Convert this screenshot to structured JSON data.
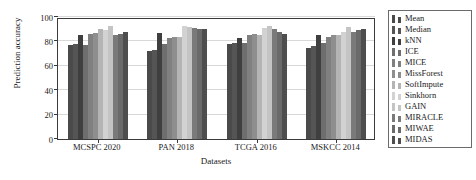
{
  "chart_data": {
    "type": "bar",
    "title": "",
    "xlabel": "Datasets",
    "ylabel": "Prediction accuracy",
    "categories": [
      "MCSPC 2020",
      "PAN 2018",
      "TCGA 2016",
      "MSKCC 2014"
    ],
    "ylim": [
      0,
      100
    ],
    "yticks": [
      0,
      20,
      40,
      60,
      80,
      100
    ],
    "ytick_labels": [
      "0",
      "20",
      "40",
      "60",
      "80",
      "100"
    ],
    "grid": true,
    "legend_position": "right-outside",
    "series": [
      {
        "name": "Mean",
        "color": "#4a4a4a",
        "values": [
          77,
          72,
          78,
          75
        ]
      },
      {
        "name": "Median",
        "color": "#555555",
        "values": [
          78,
          73,
          79,
          76
        ]
      },
      {
        "name": "kNN",
        "color": "#3f3f3f",
        "values": [
          85,
          87,
          83,
          85
        ]
      },
      {
        "name": "ICE",
        "color": "#6e6e6e",
        "values": [
          77,
          78,
          79,
          79
        ]
      },
      {
        "name": "MICE",
        "color": "#808080",
        "values": [
          86,
          83,
          85,
          84
        ]
      },
      {
        "name": "MissForest",
        "color": "#8e8e8e",
        "values": [
          87,
          84,
          86,
          85
        ]
      },
      {
        "name": "SoftImpute",
        "color": "#b4b4b4",
        "values": [
          90,
          84,
          85,
          85
        ]
      },
      {
        "name": "Sinkhorn",
        "color": "#d2d2d2",
        "values": [
          89,
          93,
          91,
          88
        ]
      },
      {
        "name": "GAIN",
        "color": "#c4c4c4",
        "values": [
          93,
          92,
          93,
          92
        ]
      },
      {
        "name": "MIRACLE",
        "color": "#7a7a7a",
        "values": [
          85,
          91,
          90,
          88
        ]
      },
      {
        "name": "MIWAE",
        "color": "#6a6a6a",
        "values": [
          86,
          90,
          88,
          89
        ]
      },
      {
        "name": "MIDAS",
        "color": "#4e4e4e",
        "values": [
          88,
          90,
          86,
          90
        ]
      }
    ]
  }
}
